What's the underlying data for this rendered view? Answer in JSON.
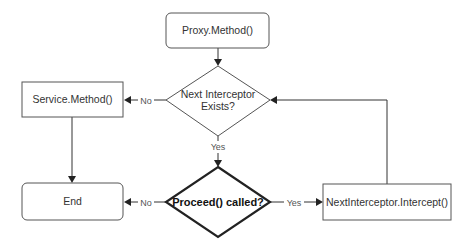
{
  "diagram": {
    "type": "flowchart",
    "nodes": {
      "proxy_method": {
        "label": "Proxy.Method()",
        "shape": "rounded-rectangle"
      },
      "next_interceptor_exists": {
        "label_line1": "Next Interceptor",
        "label_line2": "Exists?",
        "shape": "diamond"
      },
      "service_method": {
        "label": "Service.Method()",
        "shape": "rectangle"
      },
      "proceed_called": {
        "label": "Proceed() called?",
        "shape": "diamond",
        "emphasis": "bold"
      },
      "end": {
        "label": "End",
        "shape": "rounded-rectangle"
      },
      "next_interceptor_intercept": {
        "label": "NextInterceptor.Intercept()",
        "shape": "rectangle"
      }
    },
    "edges": [
      {
        "from": "proxy_method",
        "to": "next_interceptor_exists",
        "label": ""
      },
      {
        "from": "next_interceptor_exists",
        "to": "service_method",
        "label": "No"
      },
      {
        "from": "next_interceptor_exists",
        "to": "proceed_called",
        "label": "Yes"
      },
      {
        "from": "service_method",
        "to": "end",
        "label": ""
      },
      {
        "from": "proceed_called",
        "to": "end",
        "label": "No"
      },
      {
        "from": "proceed_called",
        "to": "next_interceptor_intercept",
        "label": "Yes"
      },
      {
        "from": "next_interceptor_intercept",
        "to": "next_interceptor_exists",
        "label": ""
      }
    ],
    "edge_labels": {
      "exists_no": "No",
      "exists_yes": "Yes",
      "proceed_no": "No",
      "proceed_yes": "Yes"
    }
  }
}
